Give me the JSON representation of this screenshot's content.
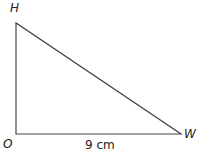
{
  "diagram": {
    "type": "right-triangle",
    "vertices": {
      "H": {
        "label": "H",
        "x": 16,
        "y": 23
      },
      "O": {
        "label": "O",
        "x": 16,
        "y": 134
      },
      "W": {
        "label": "W",
        "x": 181,
        "y": 134
      }
    },
    "sides": [
      {
        "from": "O",
        "to": "W",
        "label": "9 cm"
      },
      {
        "from": "O",
        "to": "H",
        "label": ""
      },
      {
        "from": "H",
        "to": "W",
        "label": ""
      }
    ],
    "right_angle_at": "O",
    "line_color": "#444444"
  }
}
